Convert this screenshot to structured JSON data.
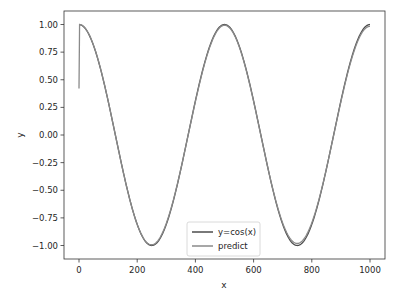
{
  "chart_data": {
    "type": "line",
    "title": "",
    "xlabel": "x",
    "ylabel": "y",
    "xlim": [
      -45,
      1050
    ],
    "ylim": [
      -1.1,
      1.1
    ],
    "grid": false,
    "legend_position": "lower center",
    "x_ticks": [
      0,
      200,
      400,
      600,
      800,
      1000
    ],
    "x_tick_labels": [
      "0",
      "200",
      "400",
      "600",
      "800",
      "1000"
    ],
    "y_ticks": [
      1.0,
      0.75,
      0.5,
      0.25,
      0.0,
      -0.25,
      -0.5,
      -0.75,
      -1.0
    ],
    "y_tick_labels": [
      "1.00",
      "0.75",
      "0.50",
      "0.25",
      "0.00",
      "−0.25",
      "−0.50",
      "−0.75",
      "−1.00"
    ],
    "x_period": 500,
    "x_range": [
      0,
      1000
    ],
    "series": [
      {
        "name": "y=cos(x)",
        "color": "#4d4d4d",
        "function": "cos(2*pi*x/500)",
        "x": [
          0,
          125,
          250,
          375,
          500,
          625,
          750,
          875,
          1000
        ],
        "values": [
          1.0,
          0.0,
          -1.0,
          0.0,
          1.0,
          0.0,
          -1.0,
          0.0,
          1.0
        ]
      },
      {
        "name": "predict",
        "color": "#8a8a8a",
        "function": "approx cos(2*pi*x/500), starts at 0.42 at x=0",
        "x": [
          0,
          2,
          125,
          250,
          375,
          500,
          625,
          750,
          875,
          1000
        ],
        "values": [
          0.42,
          1.0,
          0.0,
          -1.0,
          0.0,
          0.99,
          0.0,
          -0.99,
          0.0,
          0.98
        ]
      }
    ]
  }
}
